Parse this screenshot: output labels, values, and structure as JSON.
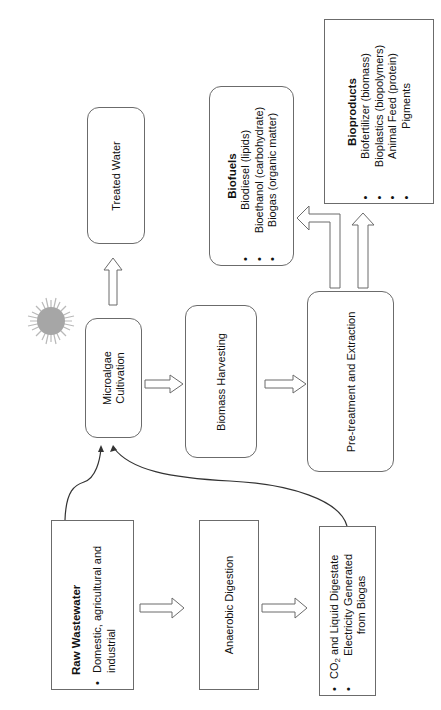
{
  "diagram": {
    "orientation": "rotated 90 degrees counter-clockwise (text reads bottom-to-top)",
    "nodes": {
      "raw_wastewater": {
        "title": "Raw Wastewater",
        "bullets": [
          "Domestic, agricultural and industrial"
        ]
      },
      "anaerobic_digestion": {
        "label": "Anaerobic Digestion"
      },
      "digestion_outputs": {
        "bullets": [
          {
            "pre": "CO",
            "sub": "2",
            "post": " and Liquid Digestate"
          },
          {
            "text": "Electricity Generated from Biogas"
          }
        ],
        "bullet_lines": [
          "Electricity Generated",
          "from Biogas"
        ]
      },
      "microalgae_cultivation": {
        "line1": "Microalgae",
        "line2": "Cultivation"
      },
      "treated_water": {
        "label": "Treated Water"
      },
      "biomass_harvesting": {
        "label": "Biomass Harvesting"
      },
      "pretreatment_extraction": {
        "label": "Pre-treatment and Extraction"
      },
      "biofuels": {
        "title": "Biofuels",
        "bullets": [
          "Biodiesel (lipids)",
          "Bioethanol (carbohydrate)",
          "Biogas (organic matter)"
        ]
      },
      "bioproducts": {
        "title": "Bioproducts",
        "bullets": [
          "Biofertilizer (biomass)",
          "Bioplastics (biopolymers)",
          "Animal Feed (protein)",
          "Pigments"
        ]
      }
    },
    "edges": [
      {
        "from": "Raw Wastewater",
        "to": "Anaerobic Digestion",
        "style": "block-arrow"
      },
      {
        "from": "Anaerobic Digestion",
        "to": "CO2 and Liquid Digestate / Electricity",
        "style": "block-arrow"
      },
      {
        "from": "Raw Wastewater",
        "to": "Microalgae Cultivation",
        "style": "curved-line"
      },
      {
        "from": "CO2 and Liquid Digestate / Electricity",
        "to": "Microalgae Cultivation",
        "style": "curved-line"
      },
      {
        "from": "Microalgae Cultivation",
        "to": "Treated Water",
        "style": "block-arrow"
      },
      {
        "from": "Microalgae Cultivation",
        "to": "Biomass Harvesting",
        "style": "block-arrow"
      },
      {
        "from": "Biomass Harvesting",
        "to": "Pre-treatment and Extraction",
        "style": "block-arrow"
      },
      {
        "from": "Pre-treatment and Extraction",
        "to": "Biofuels",
        "style": "bent-block-arrow"
      },
      {
        "from": "Pre-treatment and Extraction",
        "to": "Bioproducts",
        "style": "block-arrow"
      }
    ],
    "decor": {
      "sun_icon_color": "#a6a6a6",
      "line_color": "#333333",
      "arrow_outline_color": "#6b6b6b"
    }
  }
}
